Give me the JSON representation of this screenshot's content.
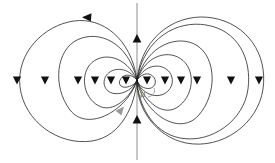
{
  "figure": {
    "width": 275,
    "height": 163,
    "background_color": "#ffffff",
    "center": {
      "x": 137,
      "y": 80
    },
    "labels": {
      "magnetic_moment": "μ"
    },
    "colors": {
      "fieldline": "#1a1a1a",
      "axis": "#8c8c8c",
      "arrow_dark": "#111111",
      "arrow_gray": "#9a9a9a",
      "label": "#777777"
    }
  },
  "axis": {
    "name": "dipole-axis",
    "orientation": "vertical",
    "x": 137,
    "y_top": 3,
    "y_bottom": 160,
    "arrowheads": [
      {
        "y": 40,
        "direction": "up"
      },
      {
        "y": 121,
        "direction": "up"
      }
    ]
  },
  "lobes": {
    "left": {
      "name": "left-lobe",
      "loop_count": 5,
      "loops": [
        {
          "index": 0,
          "outer_x": 125,
          "rx": 6,
          "ry": 7
        },
        {
          "index": 1,
          "outer_x": 112,
          "rx": 12.5,
          "ry": 14
        },
        {
          "index": 2,
          "outer_x": 92,
          "rx": 22.5,
          "ry": 27
        },
        {
          "index": 3,
          "outer_x": 61,
          "rx": 38,
          "ry": 46
        },
        {
          "index": 4,
          "outer_x": 20,
          "rx": 58.5,
          "ry": 62
        }
      ]
    },
    "right": {
      "name": "right-lobe",
      "loop_count": 6,
      "loops": [
        {
          "index": 0,
          "outer_x": 152,
          "rx": 7.5,
          "ry": 8
        },
        {
          "index": 1,
          "outer_x": 168,
          "rx": 15.5,
          "ry": 17
        },
        {
          "index": 2,
          "outer_x": 186,
          "rx": 24.5,
          "ry": 29
        },
        {
          "index": 3,
          "outer_x": 205,
          "rx": 34,
          "ry": 42
        },
        {
          "index": 4,
          "outer_x": 237,
          "rx": 50,
          "ry": 55
        },
        {
          "index": 5,
          "outer_x": 262,
          "rx": 62.5,
          "ry": 63
        }
      ]
    }
  },
  "equator_arrowheads": {
    "name": "equatorial-direction-markers",
    "direction": "down",
    "y": 80,
    "left_x": [
      17,
      45,
      78,
      95,
      111,
      126
    ],
    "right_x": [
      147,
      165,
      181,
      197,
      231,
      259
    ]
  },
  "annotations": [
    {
      "name": "outer-loop-flow-arrow",
      "style": "dark",
      "x": 88,
      "y": 17,
      "angle": 190,
      "description": "arrowhead on outermost left loop pointing left (counter-clockwise flow)"
    },
    {
      "name": "inner-loop-flow-arrow",
      "style": "gray",
      "x": 117,
      "y": 113,
      "angle": 318,
      "description": "gray arrowhead on lower-left loop pointing up-right toward origin"
    }
  ]
}
